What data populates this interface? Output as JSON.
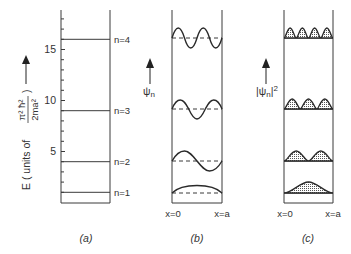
{
  "figure": {
    "panels": [
      {
        "id": "a",
        "caption": "(a)",
        "y_axis_label_prefix": "E ( units of",
        "y_axis_label_numerator": "π² ħ²",
        "y_axis_label_denominator": "2ma²",
        "y_axis_label_suffix": ")",
        "ticks": [
          "5",
          "10",
          "15"
        ],
        "levels": [
          {
            "label": "n=1",
            "energy": 1
          },
          {
            "label": "n=2",
            "energy": 4
          },
          {
            "label": "n=3",
            "energy": 9
          },
          {
            "label": "n=4",
            "energy": 16
          }
        ]
      },
      {
        "id": "b",
        "caption": "(b)",
        "axis_label": "ψn",
        "axis_label_main": "ψ",
        "axis_label_sub": "n",
        "x_left": "x=0",
        "x_right": "x=a"
      },
      {
        "id": "c",
        "caption": "(c)",
        "axis_label_main": "|ψ",
        "axis_label_sub": "n",
        "axis_label_end": "|",
        "axis_label_sup": "2",
        "x_left": "x=0",
        "x_right": "x=a"
      }
    ],
    "colors": {
      "line": "#3a3a3a",
      "text": "#333333",
      "fill_dots": "#555555"
    }
  }
}
